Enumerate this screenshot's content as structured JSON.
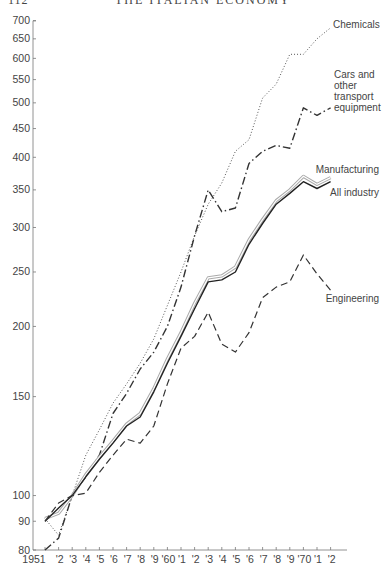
{
  "page": {
    "number": "112",
    "running_title": "THE ITALIAN ECONOMY"
  },
  "chart_data": {
    "type": "line",
    "title": "",
    "xlabel": "",
    "ylabel": "",
    "yscale": "log",
    "ylim": [
      80,
      700
    ],
    "grid": false,
    "legend_position": "inline labels at right end of lines",
    "y_ticks": [
      80,
      90,
      100,
      150,
      200,
      250,
      300,
      350,
      400,
      450,
      500,
      550,
      600,
      650,
      700
    ],
    "x": [
      1951,
      1952,
      1953,
      1954,
      1955,
      1956,
      1957,
      1958,
      1959,
      1960,
      1961,
      1962,
      1963,
      1964,
      1965,
      1966,
      1967,
      1968,
      1969,
      1970,
      1971,
      1972
    ],
    "x_tick_labels": [
      "1951",
      "'2",
      "'3",
      "'4",
      "'5",
      "'6",
      "'7",
      "'8",
      "'9",
      "'60",
      "'1",
      "'2",
      "'3",
      "'4",
      "'5",
      "'6",
      "'7",
      "'8",
      "'9",
      "'70",
      "'1",
      "'2"
    ],
    "series": [
      {
        "name": "Chemicals",
        "style": "dotted",
        "label": "Chemicals",
        "values": [
          91,
          85,
          100,
          118,
          131,
          146,
          158,
          172,
          190,
          218,
          250,
          290,
          330,
          360,
          410,
          430,
          510,
          540,
          610,
          610,
          650,
          680
        ]
      },
      {
        "name": "Cars and other transport equipment",
        "style": "dash-dot",
        "label_lines": [
          "Cars and",
          "other",
          "transport",
          "equipment"
        ],
        "values": [
          80,
          84,
          100,
          108,
          118,
          140,
          152,
          168,
          180,
          200,
          235,
          290,
          350,
          320,
          325,
          390,
          410,
          420,
          415,
          490,
          475,
          490
        ]
      },
      {
        "name": "Manufacturing",
        "style": "solid-light",
        "label": "Manufacturing",
        "values": [
          91,
          93,
          100,
          109,
          117,
          125,
          134,
          140,
          155,
          175,
          195,
          220,
          244,
          246,
          255,
          285,
          310,
          335,
          350,
          370,
          358,
          368
        ]
      },
      {
        "name": "All industry",
        "style": "solid",
        "label": "All industry",
        "values": [
          90,
          95,
          100,
          108,
          116,
          124,
          133,
          138,
          153,
          172,
          192,
          215,
          240,
          242,
          250,
          280,
          305,
          330,
          345,
          362,
          352,
          362
        ]
      },
      {
        "name": "Engineering",
        "style": "dashed",
        "label": "Engineering",
        "values": [
          90,
          97,
          100,
          101,
          110,
          118,
          126,
          124,
          133,
          158,
          183,
          192,
          212,
          186,
          180,
          195,
          225,
          235,
          240,
          268,
          248,
          232
        ]
      }
    ]
  }
}
